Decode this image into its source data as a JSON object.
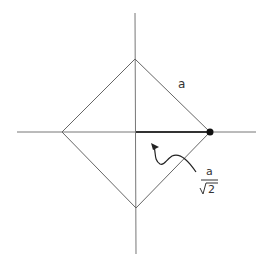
{
  "diagram": {
    "side_label": "a",
    "half_diagonal_label": {
      "numerator": "a",
      "denominator": "2",
      "radical": "√"
    },
    "colors": {
      "line": "#555555",
      "highlight": "#222222",
      "dot": "#111111"
    }
  }
}
